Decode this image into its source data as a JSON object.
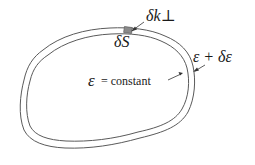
{
  "diagram": {
    "labels": {
      "delta_k_perp": "δk⊥",
      "delta_S": "δS",
      "epsilon_plus": "ε + δε",
      "epsilon_symbol": "ε",
      "constant_text": "= constant"
    },
    "colors": {
      "stroke": "#5a5a5a",
      "patch_fill": "#8a8a8a",
      "text": "#1a1a1a"
    }
  }
}
